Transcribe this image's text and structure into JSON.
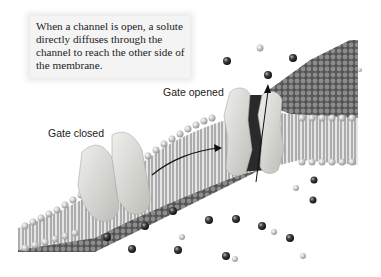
{
  "figure": {
    "caption": "When a channel is open, a solute directly diffuses through the channel to reach the other side of the membrane.",
    "labels": {
      "gate_closed": "Gate closed",
      "gate_opened": "Gate opened"
    },
    "colors": {
      "membrane_dark": "#3a3a3a",
      "membrane_mid": "#8a8a8a",
      "protein": "#d8d8d4",
      "solute": "#2a2a2a",
      "caption_bg": "#f4f4f4"
    }
  }
}
